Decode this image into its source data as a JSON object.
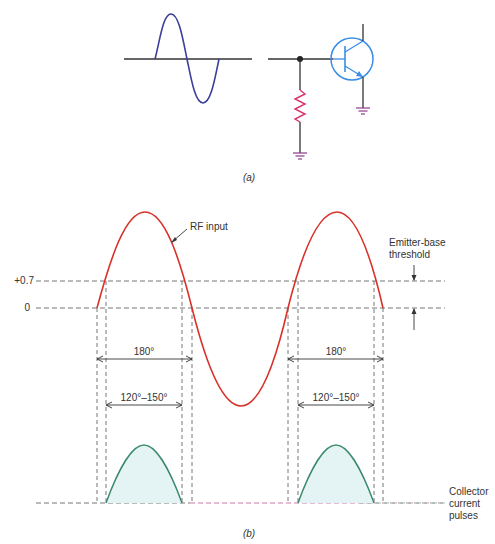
{
  "part_a": {
    "caption": "(a)",
    "colors": {
      "input_wave": "#3a3f9a",
      "wire": "#333333",
      "resistor": "#d8336a",
      "ground": "#8e3a8e",
      "transistor": "#3a8ee6"
    }
  },
  "part_b": {
    "caption": "(b)",
    "labels": {
      "rf_input": "RF input",
      "threshold_line1": "Emitter-base",
      "threshold_line2": "threshold",
      "level_07": "+0.7",
      "level_0": "0",
      "conduction_1": "180°",
      "angle_1": "120°–150°",
      "conduction_2": "180°",
      "angle_2": "120°–150°",
      "pulses_line1": "Collector",
      "pulses_line2": "current",
      "pulses_line3": "pulses"
    },
    "colors": {
      "rf_wave": "#d9302a",
      "pulse": "#3a8a70",
      "pulse_fill": "#e4f4f4",
      "dashed": "#666666"
    }
  }
}
